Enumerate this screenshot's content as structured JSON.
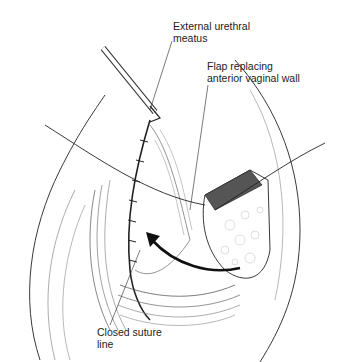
{
  "figure": {
    "labels": [
      {
        "id": "meatus",
        "text": "External urethral\nmeatus"
      },
      {
        "id": "flap",
        "text": "Flap replacing\nanterior vaginal wall"
      },
      {
        "id": "suture",
        "text": "Closed suture\nline"
      }
    ],
    "colors": {
      "ink": "#1a1a1a",
      "background": "#ffffff"
    }
  }
}
